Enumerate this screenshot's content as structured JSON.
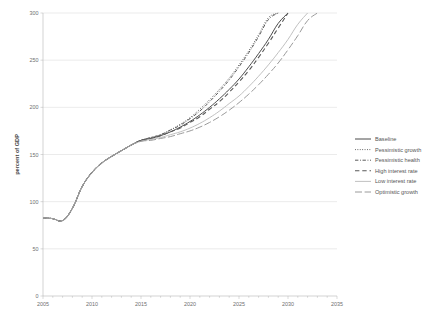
{
  "chart_data": {
    "type": "line",
    "title": "",
    "xlabel": "",
    "ylabel": "percent of GDP",
    "xlim": [
      2005,
      2035
    ],
    "ylim": [
      0,
      300
    ],
    "xticks": [
      "2005",
      "2010",
      "2015",
      "2020",
      "2025",
      "2030",
      "2035"
    ],
    "yticks": [
      "0",
      "50",
      "100",
      "150",
      "200",
      "250",
      "300"
    ],
    "x_minor_tick_interval": 1,
    "grid": "horizontal",
    "legend_position": "right",
    "x": [
      2005,
      2006,
      2007,
      2008,
      2009,
      2010,
      2011,
      2012,
      2013,
      2014,
      2015,
      2016,
      2017,
      2018,
      2019,
      2020,
      2021,
      2022,
      2023,
      2024,
      2025,
      2026,
      2027,
      2028,
      2029,
      2030,
      2031,
      2032,
      2033,
      2034,
      2035
    ],
    "series": [
      {
        "name": "Baseline",
        "style": "solid",
        "color": "#4a4a4a",
        "width": 1.0,
        "values": [
          83,
          82,
          80,
          93,
          116,
          131,
          141,
          148,
          154,
          160,
          165,
          167,
          170,
          174,
          179,
          185,
          192,
          200,
          209,
          219,
          230,
          243,
          257,
          272,
          289,
          300,
          null,
          null,
          null,
          null,
          null
        ]
      },
      {
        "name": "Pessimistic growth",
        "style": "dotted",
        "color": "#5a5a5a",
        "width": 1.0,
        "values": [
          83,
          82,
          80,
          93,
          116,
          131,
          141,
          148,
          154,
          160,
          165,
          168,
          171,
          176,
          182,
          189,
          198,
          208,
          219,
          231,
          245,
          260,
          277,
          295,
          300,
          null,
          null,
          null,
          null,
          null,
          null
        ]
      },
      {
        "name": "Pessimistic health",
        "style": "dashdot",
        "color": "#5a5a5a",
        "width": 1.0,
        "values": [
          83,
          82,
          80,
          93,
          116,
          131,
          141,
          148,
          154,
          160,
          165,
          168,
          171,
          176,
          181,
          188,
          196,
          206,
          217,
          229,
          243,
          258,
          275,
          293,
          300,
          null,
          null,
          null,
          null,
          null,
          null
        ]
      },
      {
        "name": "High interest rate",
        "style": "dashed",
        "color": "#5a5a5a",
        "width": 1.1,
        "values": [
          83,
          82,
          80,
          93,
          116,
          131,
          141,
          148,
          154,
          160,
          165,
          167,
          170,
          174,
          178,
          184,
          190,
          198,
          206,
          216,
          227,
          239,
          253,
          268,
          284,
          300,
          null,
          null,
          null,
          null,
          null
        ]
      },
      {
        "name": "Low interest rate",
        "style": "solid",
        "color": "#b9b9b9",
        "width": 0.9,
        "values": [
          83,
          82,
          80,
          93,
          116,
          131,
          141,
          148,
          154,
          160,
          164,
          166,
          168,
          171,
          174,
          178,
          183,
          189,
          196,
          204,
          212,
          222,
          233,
          245,
          258,
          272,
          288,
          300,
          null,
          null,
          null
        ]
      },
      {
        "name": "Optimistic growth",
        "style": "longdash",
        "color": "#9a9a9a",
        "width": 1.0,
        "values": [
          83,
          82,
          80,
          93,
          116,
          131,
          141,
          148,
          154,
          160,
          164,
          165,
          167,
          169,
          172,
          175,
          179,
          184,
          190,
          197,
          205,
          214,
          224,
          235,
          247,
          261,
          276,
          292,
          300,
          null,
          null
        ]
      }
    ]
  },
  "legend": {
    "items": [
      {
        "label": "Baseline"
      },
      {
        "label": "Pessimistic growth"
      },
      {
        "label": "Pessimistic health"
      },
      {
        "label": "High interest rate"
      },
      {
        "label": "Low interest rate"
      },
      {
        "label": "Optimistic growth"
      }
    ]
  }
}
